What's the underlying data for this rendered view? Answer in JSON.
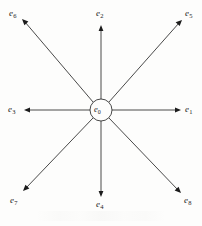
{
  "figure": {
    "background_color": "#fdfdfc",
    "stroke_color": "#1c1c1c"
  },
  "center": {
    "name": "e0",
    "symbol": "e",
    "subscript": "0",
    "cx": 101,
    "cy": 110,
    "r": 11
  },
  "spokes": [
    {
      "name": "e1",
      "symbol": "e",
      "subscript": "1",
      "direction": "right",
      "angle_deg": 0,
      "tip_x": 180,
      "tip_y": 110,
      "label_x": 185,
      "label_y": 105
    },
    {
      "name": "e2",
      "symbol": "e",
      "subscript": "2",
      "direction": "up",
      "angle_deg": 90,
      "tip_x": 101,
      "tip_y": 26,
      "label_x": 96,
      "label_y": 9
    },
    {
      "name": "e3",
      "symbol": "e",
      "subscript": "3",
      "direction": "left",
      "angle_deg": 180,
      "tip_x": 25,
      "tip_y": 110,
      "label_x": 8,
      "label_y": 105
    },
    {
      "name": "e4",
      "symbol": "e",
      "subscript": "4",
      "direction": "down",
      "angle_deg": 270,
      "tip_x": 101,
      "tip_y": 196,
      "label_x": 96,
      "label_y": 200
    },
    {
      "name": "e5",
      "symbol": "e",
      "subscript": "5",
      "direction": "up-right",
      "angle_deg": 45,
      "tip_x": 181,
      "tip_y": 21,
      "label_x": 185,
      "label_y": 9
    },
    {
      "name": "e6",
      "symbol": "e",
      "subscript": "6",
      "direction": "up-left",
      "angle_deg": 135,
      "tip_x": 23,
      "tip_y": 20,
      "label_x": 9,
      "label_y": 9
    },
    {
      "name": "e7",
      "symbol": "e",
      "subscript": "7",
      "direction": "down-left",
      "angle_deg": 225,
      "tip_x": 24,
      "tip_y": 190,
      "label_x": 10,
      "label_y": 196
    },
    {
      "name": "e8",
      "symbol": "e",
      "subscript": "8",
      "direction": "down-right",
      "angle_deg": 315,
      "tip_x": 180,
      "tip_y": 192,
      "label_x": 184,
      "label_y": 196
    }
  ]
}
